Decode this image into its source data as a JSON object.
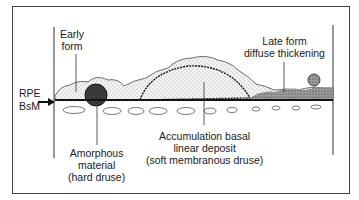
{
  "diagram": {
    "labels": {
      "early_form": [
        "Early",
        "form"
      ],
      "late_form": [
        "Late form",
        "diffuse thickening"
      ],
      "rpe": "RPE",
      "bsm": "BsM",
      "amorphous": [
        "Amorphous",
        "material",
        "(hard druse)"
      ],
      "accumulation": [
        "Accumulation basal",
        "linear deposit",
        "(soft membranous druse)"
      ]
    },
    "colors": {
      "line": "#1a1a1a",
      "hard_druse": "#3a3a3a",
      "soft_druse_fill": "#e8e8e8",
      "cell_fill": "#f2f2f2"
    }
  }
}
